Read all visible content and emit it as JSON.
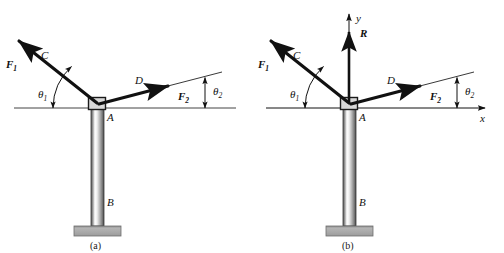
{
  "figure": {
    "background_color": "#ffffff",
    "ink_color": "#111111",
    "pole_color_light": "#fdfdfd",
    "pole_color_dark": "#4a4a4a",
    "base_color": "#a9a9a9",
    "base_edge_color": "#6e6e6e"
  },
  "panels": [
    {
      "id": "a",
      "caption": "(a)",
      "has_axes": false,
      "labels": {
        "force1": "F",
        "force1_sub": "1",
        "force2": "F",
        "force2_sub": "2",
        "cable_left": "C",
        "cable_right": "D",
        "joint": "A",
        "pole_base": "B",
        "angle1": "θ",
        "angle1_sub": "1",
        "angle2": "θ",
        "angle2_sub": "2"
      }
    },
    {
      "id": "b",
      "caption": "(b)",
      "has_axes": true,
      "labels": {
        "force1": "F",
        "force1_sub": "1",
        "force2": "F",
        "force2_sub": "2",
        "cable_left": "C",
        "cable_right": "D",
        "joint": "A",
        "pole_base": "B",
        "angle1": "θ",
        "angle1_sub": "1",
        "angle2": "θ",
        "angle2_sub": "2",
        "resultant": "R",
        "axis_y": "y",
        "axis_x": "x"
      }
    }
  ]
}
